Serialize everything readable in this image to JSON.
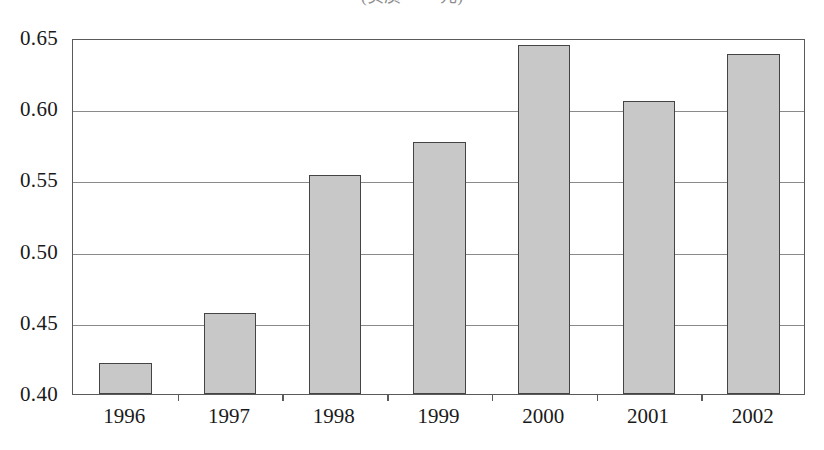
{
  "caption": {
    "text": "(实质　·　元)",
    "note": "cropped-top-caption"
  },
  "chart_data": {
    "type": "bar",
    "title": "",
    "subtitle": "",
    "xlabel": "",
    "ylabel": "",
    "categories": [
      "1996",
      "1997",
      "1998",
      "1999",
      "2000",
      "2001",
      "2002"
    ],
    "values": [
      0.422,
      0.457,
      0.554,
      0.577,
      0.645,
      0.606,
      0.639
    ],
    "series": [
      {
        "name": "",
        "values": [
          0.422,
          0.457,
          0.554,
          0.577,
          0.645,
          0.606,
          0.639
        ]
      }
    ],
    "ylim": [
      0.4,
      0.65
    ],
    "ytick_labels": [
      "0.65",
      "0.60",
      "0.55",
      "0.50",
      "0.45",
      "0.40"
    ],
    "ytick_values": [
      0.65,
      0.6,
      0.55,
      0.5,
      0.45,
      0.4
    ],
    "grid": true,
    "grid_axis": "y",
    "legend": false,
    "legend_position": "none",
    "bar_fill_color": "#c8c8c8",
    "bar_border_color": "#444444",
    "axis_color": "#5a5a5a",
    "grid_color": "#8a8a8a",
    "background_color": "#ffffff",
    "text_color": "#1a1a1a"
  }
}
